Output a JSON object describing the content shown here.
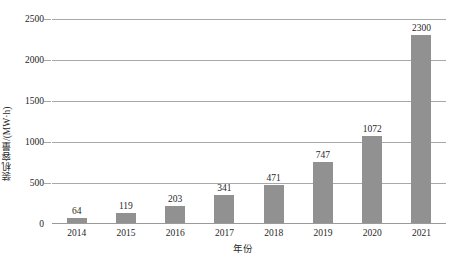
{
  "chart_data": {
    "type": "bar",
    "title": "",
    "xlabel": "年份",
    "ylabel": "装机容量/(MW·h)",
    "categories": [
      "2014",
      "2015",
      "2016",
      "2017",
      "2018",
      "2019",
      "2020",
      "2021"
    ],
    "values": [
      64,
      119,
      203,
      341,
      471,
      747,
      1072,
      2300
    ],
    "value_labels": [
      "64",
      "119",
      "203",
      "341",
      "471",
      "747",
      "1072",
      "2300"
    ],
    "ylim": [
      0,
      2500
    ],
    "yticks": [
      0,
      500,
      1000,
      1500,
      2000,
      2500
    ],
    "ytick_labels": [
      "0",
      "500",
      "1000",
      "1500",
      "2000",
      "2500"
    ],
    "grid": true,
    "legend": null,
    "legend_position": "none",
    "series": [
      {
        "name": "装机容量",
        "values": [
          64,
          119,
          203,
          341,
          471,
          747,
          1072,
          2300
        ],
        "color": "#919191"
      }
    ],
    "colors": {
      "bar": "#919191",
      "gridline": "#a8a8a8",
      "text": "#1f1f1f",
      "background": "#ffffff"
    }
  }
}
